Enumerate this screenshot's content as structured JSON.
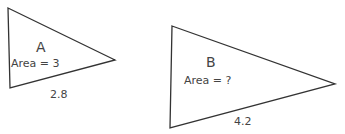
{
  "triangles": [
    {
      "name": "A",
      "area_label": "Area = 3",
      "base_label": "2.8"
    },
    {
      "name": "B",
      "area_label": "Area = ?",
      "base_label": "4.2"
    }
  ]
}
